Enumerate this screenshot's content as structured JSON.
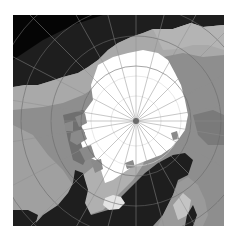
{
  "map": {
    "projection": "polar-stereographic",
    "region": "Arctic",
    "pole_marker": "north-pole",
    "colors": {
      "ocean": "#1e1e1e",
      "land_light": "#a9a9a9",
      "land_mid": "#8e8e8e",
      "land_dark": "#6f6f6f",
      "sea_ice": "#ffffff",
      "graticule": "#6a6a6a",
      "ice_graticule": "#d8d8d8",
      "pole": "#6a6a6a"
    },
    "features": [
      {
        "name": "sea-ice",
        "label": ""
      },
      {
        "name": "greenland",
        "label": ""
      },
      {
        "name": "iceland",
        "label": ""
      },
      {
        "name": "canadian-archipelago",
        "label": ""
      },
      {
        "name": "siberia",
        "label": ""
      },
      {
        "name": "scandinavia",
        "label": ""
      },
      {
        "name": "north-atlantic",
        "label": ""
      }
    ]
  }
}
